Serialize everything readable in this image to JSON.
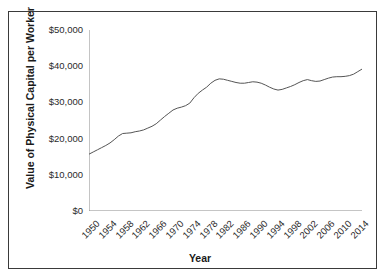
{
  "chart_data": {
    "type": "line",
    "title": "",
    "xlabel": "Year",
    "ylabel": "Value of Physical Capital per Worker",
    "xlim": [
      1950,
      2015
    ],
    "ylim": [
      0,
      50000
    ],
    "grid": false,
    "legend": "none",
    "ytick_labels": [
      "$50,000",
      "$40,000",
      "$30,000",
      "$20,000",
      "$10,000",
      "$0"
    ],
    "ytick_values": [
      50000,
      40000,
      30000,
      20000,
      10000,
      0
    ],
    "xtick_labels": [
      "1950",
      "1954",
      "1958",
      "1962",
      "1966",
      "1970",
      "1974",
      "1978",
      "1982",
      "1986",
      "1990",
      "1994",
      "1998",
      "2002",
      "2006",
      "2010",
      "2014"
    ],
    "xtick_values": [
      1950,
      1954,
      1958,
      1962,
      1966,
      1970,
      1974,
      1978,
      1982,
      1986,
      1990,
      1994,
      1998,
      2002,
      2006,
      2010,
      2014
    ],
    "series": [
      {
        "name": "Value of Physical Capital per Worker",
        "color": "#555555",
        "x": [
          1950,
          1951,
          1952,
          1953,
          1954,
          1955,
          1956,
          1957,
          1958,
          1959,
          1960,
          1961,
          1962,
          1963,
          1964,
          1965,
          1966,
          1967,
          1968,
          1969,
          1970,
          1971,
          1972,
          1973,
          1974,
          1975,
          1976,
          1977,
          1978,
          1979,
          1980,
          1981,
          1982,
          1983,
          1984,
          1985,
          1986,
          1987,
          1988,
          1989,
          1990,
          1991,
          1992,
          1993,
          1994,
          1995,
          1996,
          1997,
          1998,
          1999,
          2000,
          2001,
          2002,
          2003,
          2004,
          2005,
          2006,
          2007,
          2008,
          2009,
          2010,
          2011,
          2012,
          2013,
          2014,
          2015
        ],
        "y": [
          15700,
          16300,
          16900,
          17500,
          18100,
          18800,
          19700,
          20700,
          21400,
          21500,
          21600,
          21900,
          22100,
          22400,
          22900,
          23400,
          24100,
          25100,
          26100,
          27000,
          27900,
          28400,
          28700,
          29100,
          29800,
          31300,
          32500,
          33400,
          34200,
          35300,
          36100,
          36500,
          36400,
          36100,
          35800,
          35500,
          35300,
          35300,
          35500,
          35700,
          35600,
          35300,
          34800,
          34200,
          33700,
          33400,
          33600,
          34000,
          34400,
          34900,
          35500,
          36000,
          36300,
          36000,
          35800,
          35900,
          36300,
          36700,
          37000,
          37100,
          37100,
          37200,
          37400,
          37800,
          38500,
          39200
        ]
      }
    ]
  }
}
